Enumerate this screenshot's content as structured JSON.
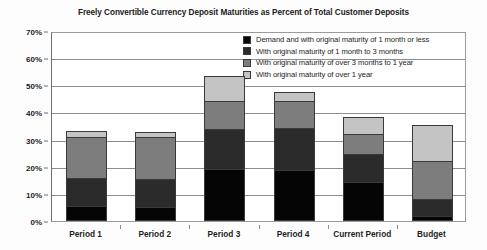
{
  "chart_data": {
    "type": "bar",
    "title": "Freely Convertible Currency Deposit Maturities as Percent of Total Customer Deposits",
    "xlabel": "",
    "ylabel": "",
    "stacked": true,
    "grid": true,
    "legend_position": "top-right",
    "ylim": [
      0,
      70
    ],
    "ytick_labels": [
      "0%",
      "10%",
      "20%",
      "30%",
      "40%",
      "50%",
      "60%",
      "70%"
    ],
    "ytick_values": [
      0,
      10,
      20,
      30,
      40,
      50,
      60,
      70
    ],
    "categories": [
      "Period 1",
      "Period 2",
      "Period 3",
      "Period 4",
      "Current Period",
      "Budget"
    ],
    "series": [
      {
        "name": "Demand and with original maturity of 1 month or less",
        "color": "#050505",
        "values": [
          5.5,
          5.2,
          19.0,
          18.7,
          14.2,
          2.0
        ]
      },
      {
        "name": "With original maturity of 1 month to 3 months",
        "color": "#2b2b2b",
        "values": [
          10.4,
          10.4,
          15.0,
          15.7,
          10.5,
          6.0
        ]
      },
      {
        "name": "With original maturity of over 3 months to 1 year",
        "color": "#7d7d7d",
        "values": [
          15.0,
          15.2,
          10.1,
          9.8,
          7.5,
          14.0
        ]
      },
      {
        "name": "With original maturity of over 1 year",
        "color": "#c4c4c4",
        "values": [
          2.1,
          1.9,
          9.2,
          3.3,
          6.3,
          13.2
        ]
      }
    ],
    "totals": [
      33.0,
      32.7,
      53.3,
      47.5,
      38.5,
      35.2
    ]
  }
}
